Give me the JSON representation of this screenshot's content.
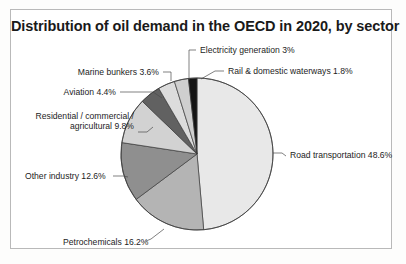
{
  "figure": {
    "title": "Distribution of oil demand in the OECD in 2020, by sector",
    "background": "#ffffff",
    "border_color": "#b9b9b9"
  },
  "chart_data": {
    "type": "pie",
    "title": "Distribution of oil demand in the OECD in 2020, by sector",
    "xlabel": "",
    "ylabel": "",
    "units": "percent",
    "legend_position": "none",
    "grid": false,
    "start_angle_deg": 0,
    "direction": "clockwise",
    "center": [
      196,
      153
    ],
    "radius": 76,
    "categories": [
      "Road transportation",
      "Petrochemicals",
      "Other industry",
      "Residential / commercial / agricultural",
      "Aviation",
      "Marine bunkers",
      "Electricity generation",
      "Rail & domestic waterways"
    ],
    "values": [
      48.6,
      16.2,
      12.6,
      9.8,
      4.4,
      3.6,
      3.0,
      1.8
    ],
    "value_labels": [
      "48.6%",
      "16.2%",
      "12.6%",
      "9.8%",
      "4.4%",
      "3.6%",
      "3%",
      "1.8%"
    ],
    "colors": [
      "#e8e8e8",
      "#b4b4b4",
      "#8f8f8f",
      "#d2d2d2",
      "#616161",
      "#dcdcdc",
      "#cfcfcf",
      "#141414"
    ],
    "slices": [
      {
        "label": "Road transportation 48.6%",
        "name": "Road transportation",
        "value": 48.6,
        "color": "#e8e8e8",
        "label_x": 289,
        "label_y": 157,
        "label_anchor": "start",
        "leader": "M 272 152 L 281 152 L 285 155"
      },
      {
        "label": "Petrochemicals 16.2%",
        "name": "Petrochemicals",
        "value": 16.2,
        "color": "#b4b4b4",
        "label_x": 62,
        "label_y": 244,
        "label_anchor": "start",
        "leader": "M 163 228 L 150 238 L 145 240"
      },
      {
        "label": "Other industry 12.6%",
        "name": "Other industry",
        "value": 12.6,
        "color": "#8f8f8f",
        "label_x": 24,
        "label_y": 178,
        "label_anchor": "start",
        "leader": "M 112 175 L 122 175 L 127 176"
      },
      {
        "label_line1": "Residential / commercial /",
        "label_line2": "agricultural 9.8%",
        "name": "Residential / commercial / agricultural",
        "value": 9.8,
        "color": "#d2d2d2",
        "label_x": 133,
        "label_y": 118,
        "label_anchor": "end",
        "leader": "M 137 131 L 146 131 L 152 126"
      },
      {
        "label": "Aviation 4.4%",
        "name": "Aviation",
        "value": 4.4,
        "color": "#616161",
        "label_x": 115,
        "label_y": 94,
        "label_anchor": "end",
        "leader": "M 119 91 L 152 91 L 161 97"
      },
      {
        "label": "Marine bunkers 3.6%",
        "name": "Marine bunkers",
        "value": 3.6,
        "color": "#dcdcdc",
        "label_x": 158,
        "label_y": 74,
        "label_anchor": "end",
        "leader": "M 162 71 L 170 71 L 170 80"
      },
      {
        "label": "Electricity generation 3%",
        "name": "Electricity generation",
        "value": 3.0,
        "color": "#cfcfcf",
        "label_x": 199,
        "label_y": 52,
        "label_anchor": "start",
        "leader": "M 195 49 L 188 49 L 188 79"
      },
      {
        "label": "Rail & domestic waterways 1.8%",
        "name": "Rail & domestic waterways",
        "value": 1.8,
        "color": "#141414",
        "label_x": 227,
        "label_y": 73,
        "label_anchor": "start",
        "leader": "M 223 70 L 214 70 L 200 78"
      }
    ]
  }
}
